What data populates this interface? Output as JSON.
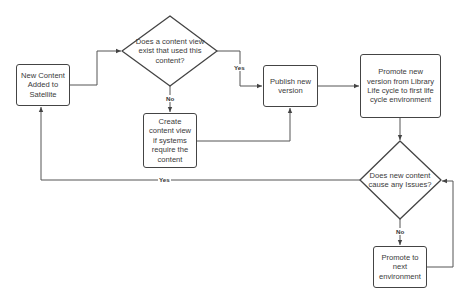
{
  "diagram": {
    "type": "flowchart",
    "nodes": {
      "new_content": {
        "label": "New Content Added to Satellite",
        "shape": "rectangle"
      },
      "cv_exists": {
        "label": "Does a content view exist that used this content?",
        "shape": "diamond"
      },
      "create_cv": {
        "label": "Create content view if systems require the content",
        "shape": "rectangle"
      },
      "publish": {
        "label": "Publish new version",
        "shape": "rectangle"
      },
      "promote_first": {
        "label": "Promote new version from Library Life cycle to first life cycle environment",
        "shape": "rectangle"
      },
      "issues": {
        "label": "Does new content cause any Issues?",
        "shape": "diamond"
      },
      "promote_next": {
        "label": "Promote to next environment",
        "shape": "rectangle"
      }
    },
    "edges": [
      {
        "from": "new_content",
        "to": "cv_exists",
        "label": ""
      },
      {
        "from": "cv_exists",
        "to": "publish",
        "label": "Yes"
      },
      {
        "from": "cv_exists",
        "to": "create_cv",
        "label": "No"
      },
      {
        "from": "create_cv",
        "to": "publish",
        "label": ""
      },
      {
        "from": "publish",
        "to": "promote_first",
        "label": ""
      },
      {
        "from": "promote_first",
        "to": "issues",
        "label": ""
      },
      {
        "from": "issues",
        "to": "new_content",
        "label": "Yes"
      },
      {
        "from": "issues",
        "to": "promote_next",
        "label": "No"
      },
      {
        "from": "promote_next",
        "to": "issues",
        "label": ""
      }
    ],
    "edge_labels": {
      "cv_yes": "Yes",
      "cv_no": "No",
      "issues_yes": "Yes",
      "issues_no": "No"
    },
    "colors": {
      "stroke": "#444444",
      "text": "#3a3a3a",
      "background": "#ffffff"
    }
  }
}
